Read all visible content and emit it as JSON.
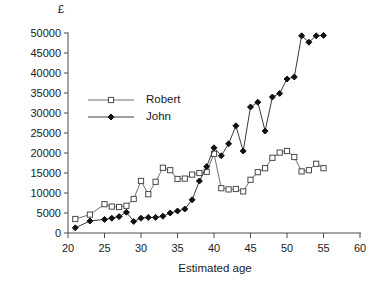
{
  "chart_data": {
    "type": "line",
    "title": "",
    "xlabel": "Estimated age",
    "ylabel": "",
    "unit_label": "£",
    "xlim": [
      20,
      60
    ],
    "ylim": [
      0,
      50000
    ],
    "xticks": [
      20,
      25,
      30,
      35,
      40,
      45,
      50,
      55,
      60
    ],
    "yticks": [
      0,
      5000,
      10000,
      15000,
      20000,
      25000,
      30000,
      35000,
      40000,
      45000,
      50000
    ],
    "grid": false,
    "legend_position": "upper-left-inside",
    "series": [
      {
        "name": "Robert",
        "marker": "open-square",
        "color": "#6f6f6f",
        "x": [
          21,
          23,
          25,
          26,
          27,
          28,
          29,
          30,
          31,
          32,
          33,
          34,
          35,
          36,
          37,
          38,
          39,
          40,
          41,
          42,
          43,
          44,
          45,
          46,
          47,
          48,
          49,
          50,
          51,
          52,
          53,
          54,
          55
        ],
        "y": [
          3500,
          4600,
          7200,
          6600,
          6500,
          6800,
          8500,
          13000,
          9700,
          12800,
          16300,
          15700,
          13500,
          13600,
          14600,
          15000,
          15300,
          19800,
          11200,
          10900,
          11000,
          10400,
          13300,
          15200,
          16200,
          18800,
          20100,
          20500,
          19000,
          15400,
          15700,
          17300,
          16200
        ]
      },
      {
        "name": "John",
        "marker": "filled-diamond",
        "color": "#111111",
        "x": [
          21,
          23,
          25,
          26,
          27,
          28,
          29,
          30,
          31,
          32,
          33,
          34,
          35,
          36,
          37,
          38,
          39,
          40,
          41,
          42,
          43,
          44,
          45,
          46,
          47,
          48,
          49,
          50,
          51,
          52,
          53,
          54,
          55
        ],
        "y": [
          1300,
          3000,
          3400,
          3700,
          4100,
          5200,
          2900,
          3700,
          3900,
          3900,
          4200,
          5000,
          5500,
          6000,
          8300,
          13000,
          16600,
          21300,
          19300,
          22300,
          26800,
          20500,
          31500,
          32700,
          25500,
          34000,
          34900,
          38500,
          39000,
          49300,
          47700,
          49300,
          49400
        ]
      }
    ]
  },
  "legend": {
    "entries": [
      {
        "label": "Robert",
        "marker": "open-square"
      },
      {
        "label": "John",
        "marker": "filled-diamond"
      }
    ]
  }
}
